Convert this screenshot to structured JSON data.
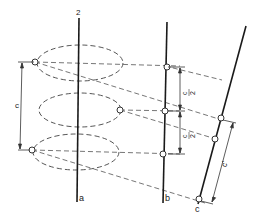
{
  "diagram": {
    "colors": {
      "axis": "#1a1a1a",
      "dashed": "#555555",
      "point_fill": "#ffffff",
      "text": "#222222"
    },
    "axes": [
      {
        "id": "a",
        "label": "a",
        "top_label": "2"
      },
      {
        "id": "b",
        "label": "b"
      },
      {
        "id": "c",
        "label": "c"
      }
    ],
    "dimensions": {
      "left": "c",
      "b_upper": "c/2",
      "b_lower": "c/2",
      "c_inclined": "c'"
    },
    "labels": {
      "top_axis": "2",
      "axis_a": "a",
      "axis_b": "b",
      "axis_c": "c",
      "dim_c": "c",
      "dim_c_half_numer": "c",
      "dim_c_half_denom": "2",
      "dim_c_half_numer2": "c",
      "dim_c_half_denom2": "2",
      "dim_c_prime": "c'"
    }
  }
}
